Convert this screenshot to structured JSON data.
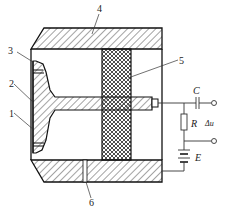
{
  "diagram": {
    "type": "sensor cross-section schematic",
    "part_labels": [
      {
        "id": "1",
        "text": "1"
      },
      {
        "id": "2",
        "text": "2"
      },
      {
        "id": "3",
        "text": "3"
      },
      {
        "id": "4",
        "text": "4"
      },
      {
        "id": "5",
        "text": "5"
      },
      {
        "id": "6",
        "text": "6"
      }
    ],
    "circuit": {
      "capacitor": "C",
      "resistor": "R",
      "battery": "E",
      "output": "Δu"
    }
  }
}
